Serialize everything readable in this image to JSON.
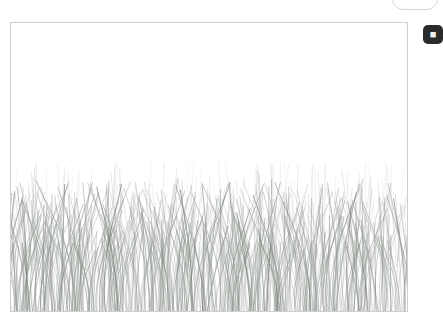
{
  "app": {
    "background_color": "#ffffff"
  },
  "canvas": {
    "name": "drawing-canvas",
    "border_color": "#cfcfcf",
    "background_color": "#ffffff",
    "x": 10,
    "y": 22,
    "width": 398,
    "height": 290,
    "sky_label": "",
    "artwork_description": ""
  },
  "top_pill": {
    "name": "rounded-pill-control",
    "label": "",
    "border_color": "#d8d8d8"
  },
  "side_button": {
    "name": "side-action-button",
    "glyph": "■",
    "background_color": "#2b2b2b",
    "glyph_color": "#f2f2f2",
    "label": ""
  },
  "chart_data": {
    "type": "scatter",
    "title": "",
    "xlabel": "",
    "ylabel": "",
    "grid": false,
    "legend": null,
    "xlim": [
      0,
      398
    ],
    "ylim": [
      0,
      290
    ],
    "ground_line_y": 290,
    "grass_top_y": 163,
    "blade_color": "#9aa09a",
    "blade_color_dark": "#6f756f",
    "blade_count": 560,
    "blade_min_height": 60,
    "blade_max_height": 132
  }
}
